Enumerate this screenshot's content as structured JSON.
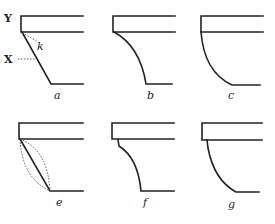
{
  "figure": {
    "annotations": {
      "Y": "Y",
      "X": "X",
      "k": "k"
    },
    "panels": [
      {
        "id": "a",
        "label": "a",
        "profile": "straight chamfer"
      },
      {
        "id": "b",
        "label": "b",
        "profile": "concave curve"
      },
      {
        "id": "c",
        "label": "c",
        "profile": "convex quarter-round"
      },
      {
        "id": "e",
        "label": "e",
        "profile": "straight with dotted convex/concave alternatives"
      },
      {
        "id": "f",
        "label": "f",
        "profile": "concave curve with step"
      },
      {
        "id": "g",
        "label": "g",
        "profile": "convex curve with step"
      }
    ]
  }
}
